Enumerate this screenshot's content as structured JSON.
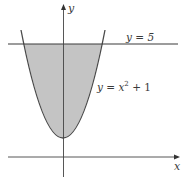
{
  "diagram": {
    "axes": {
      "x_label": "x",
      "y_label": "y"
    },
    "curves": {
      "parabola_label_prefix": "y = x",
      "parabola_exponent": "2",
      "parabola_label_suffix": " + 1",
      "line_label": "y = 5"
    },
    "colors": {
      "shaded_region": "#c4c4c4",
      "curve_stroke": "#4a4a4a",
      "axis_stroke": "#3a3a3a",
      "text": "#3a3a3a"
    }
  }
}
